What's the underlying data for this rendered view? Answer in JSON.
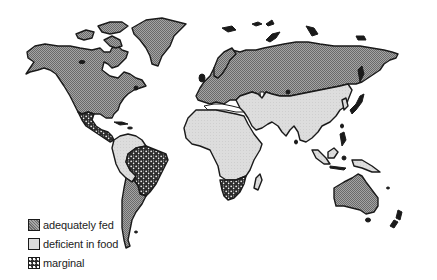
{
  "map": {
    "type": "world map",
    "projection": "Miller-like cylindrical",
    "colors": {
      "adequately_fed": "#8c8c8c",
      "deficient_in_food": "#dcdcdc",
      "marginal": "#2a2a2a",
      "outline": "#1a1a1a",
      "background": "#ffffff"
    },
    "regions": [
      {
        "name": "North America",
        "category": "adequately fed"
      },
      {
        "name": "Greenland",
        "category": "adequately fed"
      },
      {
        "name": "Europe",
        "category": "adequately fed"
      },
      {
        "name": "Soviet Union",
        "category": "adequately fed"
      },
      {
        "name": "Australia",
        "category": "adequately fed"
      },
      {
        "name": "New Zealand",
        "category": "adequately fed"
      },
      {
        "name": "Argentina / Southern Cone",
        "category": "adequately fed"
      },
      {
        "name": "Central America & Mexico",
        "category": "marginal"
      },
      {
        "name": "Brazil",
        "category": "marginal"
      },
      {
        "name": "South Africa",
        "category": "marginal"
      },
      {
        "name": "Northern South America",
        "category": "deficient in food"
      },
      {
        "name": "Africa",
        "category": "deficient in food"
      },
      {
        "name": "Middle East",
        "category": "deficient in food"
      },
      {
        "name": "South Asia",
        "category": "deficient in food"
      },
      {
        "name": "China",
        "category": "deficient in food"
      },
      {
        "name": "Southeast Asia",
        "category": "deficient in food"
      },
      {
        "name": "Madagascar",
        "category": "deficient in food"
      }
    ]
  },
  "legend": {
    "items": [
      {
        "label": "adequately fed",
        "pattern": "fed"
      },
      {
        "label": "deficient in food",
        "pattern": "def"
      },
      {
        "label": "marginal",
        "pattern": "mar"
      }
    ]
  }
}
